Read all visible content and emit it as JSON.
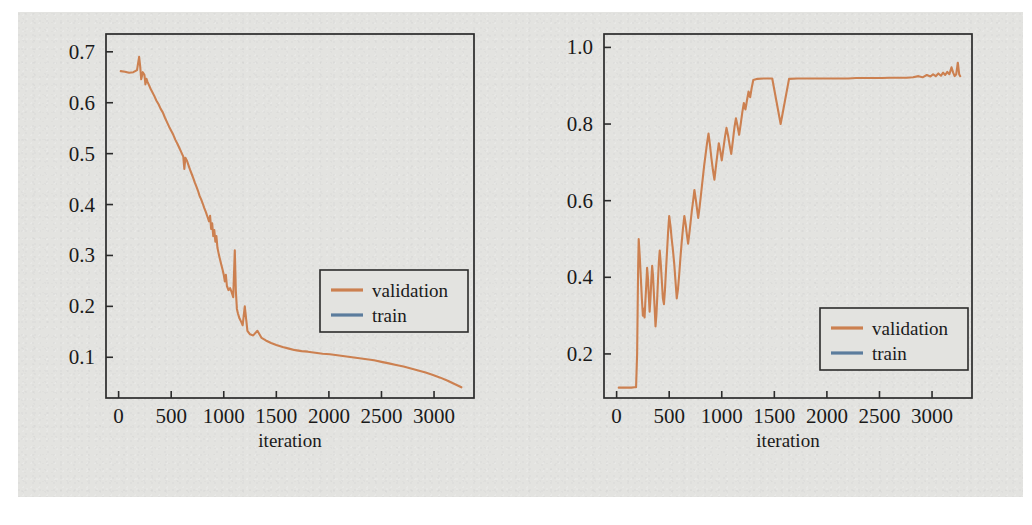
{
  "figure": {
    "background_color": "#e3e3e0",
    "axis_color": "#2b2b2b",
    "series_colors": {
      "validation": "#cc8050",
      "train": "#5b7c9d"
    }
  },
  "chart_data": [
    {
      "id": "left",
      "type": "line",
      "title": "",
      "xlabel": "iteration",
      "ylabel": "loss",
      "xlim": [
        -120,
        3380
      ],
      "ylim": [
        0.02,
        0.735
      ],
      "xticks": [
        0,
        500,
        1000,
        1500,
        2000,
        2500,
        3000
      ],
      "xtick_labels": [
        "0",
        "500",
        "1000",
        "1500",
        "2000",
        "2500",
        "3000"
      ],
      "yticks": [
        0.1,
        0.2,
        0.3,
        0.4,
        0.5,
        0.6,
        0.7
      ],
      "ytick_labels": [
        "0.1",
        "0.2",
        "0.3",
        "0.4",
        "0.5",
        "0.6",
        "0.7"
      ],
      "grid": false,
      "legend_position": "center-right",
      "legend": [
        "validation",
        "train"
      ],
      "series": [
        {
          "name": "validation",
          "color": "#cc8050",
          "x": [
            20,
            60,
            100,
            140,
            175,
            195,
            205,
            215,
            230,
            245,
            255,
            265,
            275,
            290,
            305,
            320,
            340,
            360,
            380,
            400,
            420,
            440,
            460,
            480,
            500,
            520,
            540,
            560,
            580,
            600,
            615,
            625,
            635,
            650,
            665,
            680,
            695,
            710,
            725,
            740,
            755,
            770,
            785,
            800,
            815,
            830,
            845,
            860,
            870,
            880,
            890,
            900,
            910,
            920,
            930,
            940,
            950,
            960,
            975,
            990,
            1000,
            1010,
            1020,
            1030,
            1045,
            1060,
            1075,
            1090,
            1105,
            1115,
            1125,
            1135,
            1150,
            1165,
            1180,
            1200,
            1225,
            1250,
            1280,
            1320,
            1360,
            1400,
            1450,
            1500,
            1560,
            1620,
            1680,
            1740,
            1800,
            1870,
            1940,
            2010,
            2080,
            2150,
            2220,
            2290,
            2360,
            2430,
            2500,
            2570,
            2640,
            2710,
            2780,
            2850,
            2920,
            2990,
            3060,
            3130,
            3200,
            3260
          ],
          "y": [
            0.662,
            0.661,
            0.659,
            0.66,
            0.664,
            0.69,
            0.672,
            0.646,
            0.66,
            0.655,
            0.636,
            0.647,
            0.641,
            0.634,
            0.627,
            0.621,
            0.613,
            0.604,
            0.597,
            0.588,
            0.581,
            0.571,
            0.562,
            0.553,
            0.545,
            0.537,
            0.527,
            0.519,
            0.51,
            0.501,
            0.494,
            0.47,
            0.492,
            0.486,
            0.477,
            0.468,
            0.46,
            0.452,
            0.443,
            0.435,
            0.427,
            0.417,
            0.41,
            0.402,
            0.393,
            0.385,
            0.376,
            0.367,
            0.378,
            0.352,
            0.363,
            0.338,
            0.35,
            0.327,
            0.338,
            0.315,
            0.305,
            0.296,
            0.283,
            0.271,
            0.262,
            0.249,
            0.262,
            0.24,
            0.232,
            0.236,
            0.228,
            0.218,
            0.31,
            0.23,
            0.195,
            0.186,
            0.176,
            0.17,
            0.163,
            0.2,
            0.152,
            0.145,
            0.143,
            0.152,
            0.138,
            0.133,
            0.128,
            0.124,
            0.12,
            0.117,
            0.114,
            0.112,
            0.111,
            0.109,
            0.107,
            0.106,
            0.104,
            0.102,
            0.1,
            0.098,
            0.096,
            0.094,
            0.091,
            0.088,
            0.085,
            0.082,
            0.078,
            0.074,
            0.07,
            0.065,
            0.06,
            0.054,
            0.047,
            0.041
          ]
        },
        {
          "name": "train",
          "color": "#5b7c9d",
          "x": [],
          "y": []
        }
      ]
    },
    {
      "id": "right",
      "type": "line",
      "title": "",
      "xlabel": "iteration",
      "ylabel": "loss",
      "xlim": [
        -120,
        3380
      ],
      "ylim": [
        0.085,
        1.035
      ],
      "xticks": [
        0,
        500,
        1000,
        1500,
        2000,
        2500,
        3000
      ],
      "xtick_labels": [
        "0",
        "500",
        "1000",
        "1500",
        "2000",
        "2500",
        "3000"
      ],
      "yticks": [
        0.2,
        0.4,
        0.6,
        0.8,
        1.0
      ],
      "ytick_labels": [
        "0.2",
        "0.4",
        "0.6",
        "0.8",
        "1.0"
      ],
      "grid": false,
      "legend_position": "lower-right",
      "legend": [
        "validation",
        "train"
      ],
      "series": [
        {
          "name": "validation",
          "color": "#cc8050",
          "x": [
            20,
            60,
            100,
            140,
            170,
            185,
            195,
            200,
            205,
            210,
            220,
            230,
            240,
            250,
            258,
            266,
            274,
            282,
            290,
            298,
            306,
            314,
            322,
            330,
            338,
            346,
            354,
            362,
            370,
            378,
            386,
            394,
            402,
            410,
            420,
            430,
            440,
            450,
            460,
            470,
            480,
            490,
            500,
            512,
            524,
            536,
            548,
            560,
            572,
            584,
            596,
            608,
            620,
            632,
            644,
            656,
            668,
            680,
            692,
            704,
            716,
            728,
            740,
            752,
            764,
            776,
            790,
            804,
            818,
            832,
            846,
            860,
            874,
            888,
            902,
            916,
            930,
            944,
            958,
            972,
            986,
            1000,
            1015,
            1030,
            1045,
            1060,
            1075,
            1090,
            1105,
            1120,
            1135,
            1150,
            1165,
            1180,
            1195,
            1210,
            1225,
            1240,
            1255,
            1270,
            1285,
            1300,
            1340,
            1400,
            1480,
            1560,
            1640,
            1720,
            1800,
            1880,
            1960,
            2040,
            2120,
            2200,
            2280,
            2360,
            2440,
            2520,
            2600,
            2680,
            2760,
            2820,
            2870,
            2910,
            2950,
            2985,
            3010,
            3035,
            3060,
            3085,
            3105,
            3125,
            3145,
            3165,
            3185,
            3200,
            3215,
            3230,
            3245,
            3258,
            3268
          ],
          "y": [
            0.112,
            0.112,
            0.112,
            0.112,
            0.113,
            0.113,
            0.2,
            0.32,
            0.43,
            0.5,
            0.455,
            0.4,
            0.345,
            0.3,
            0.318,
            0.295,
            0.34,
            0.38,
            0.425,
            0.398,
            0.352,
            0.31,
            0.345,
            0.392,
            0.43,
            0.405,
            0.36,
            0.318,
            0.272,
            0.3,
            0.345,
            0.395,
            0.44,
            0.47,
            0.435,
            0.39,
            0.345,
            0.33,
            0.368,
            0.42,
            0.47,
            0.52,
            0.56,
            0.535,
            0.5,
            0.47,
            0.435,
            0.39,
            0.345,
            0.37,
            0.41,
            0.455,
            0.495,
            0.53,
            0.56,
            0.54,
            0.512,
            0.488,
            0.515,
            0.545,
            0.575,
            0.6,
            0.628,
            0.605,
            0.58,
            0.555,
            0.585,
            0.62,
            0.655,
            0.69,
            0.72,
            0.75,
            0.775,
            0.745,
            0.71,
            0.68,
            0.655,
            0.688,
            0.72,
            0.75,
            0.73,
            0.705,
            0.735,
            0.765,
            0.79,
            0.77,
            0.745,
            0.722,
            0.755,
            0.79,
            0.815,
            0.795,
            0.772,
            0.8,
            0.83,
            0.855,
            0.838,
            0.862,
            0.885,
            0.87,
            0.895,
            0.915,
            0.918,
            0.919,
            0.919,
            0.8,
            0.918,
            0.919,
            0.919,
            0.919,
            0.919,
            0.919,
            0.919,
            0.919,
            0.92,
            0.92,
            0.92,
            0.92,
            0.921,
            0.921,
            0.921,
            0.922,
            0.925,
            0.922,
            0.928,
            0.924,
            0.93,
            0.925,
            0.932,
            0.926,
            0.934,
            0.928,
            0.936,
            0.93,
            0.948,
            0.935,
            0.925,
            0.93,
            0.96,
            0.93,
            0.925,
            0.935,
            1.0
          ]
        },
        {
          "name": "train",
          "color": "#5b7c9d",
          "x": [],
          "y": []
        }
      ]
    }
  ]
}
